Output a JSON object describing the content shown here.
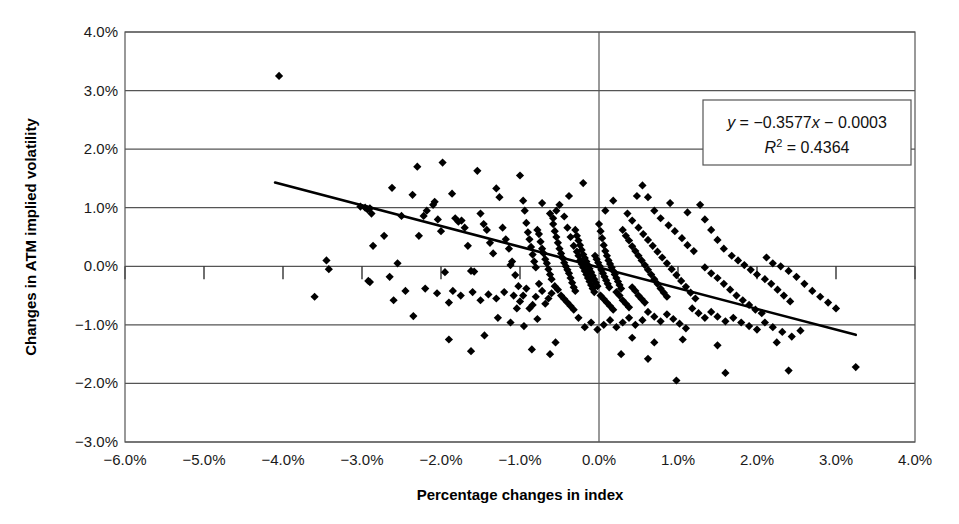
{
  "chart_data": {
    "type": "scatter",
    "title": "",
    "xlabel": "Percentage changes in index",
    "ylabel": "Changes in ATM implied volatility",
    "xlim": [
      -6.0,
      4.0
    ],
    "ylim": [
      -3.0,
      4.0
    ],
    "x_ticks": [
      "-6.0%",
      "-5.0%",
      "-4.0%",
      "-3.0%",
      "-2.0%",
      "-1.0%",
      "0.0%",
      "1.0%",
      "2.0%",
      "3.0%",
      "4.0%"
    ],
    "y_ticks": [
      "4.0%",
      "3.0%",
      "2.0%",
      "1.0%",
      "0.0%",
      "-1.0%",
      "-2.0%",
      "-3.0%"
    ],
    "x_tick_values": [
      -6,
      -5,
      -4,
      -3,
      -2,
      -1,
      0,
      1,
      2,
      3,
      4
    ],
    "y_tick_values": [
      4,
      3,
      2,
      1,
      0,
      -1,
      -2,
      -3
    ],
    "grid": "horizontal-gridlines-plus-zero-vertical",
    "legend": "none",
    "marker": "diamond",
    "marker_color": "#000000",
    "trendline": {
      "equation_label": "y = −0.3577x − 0.0003",
      "r2_label": "R² = 0.4364",
      "slope": -0.3577,
      "intercept": -0.0003,
      "r_squared": 0.4364,
      "x_start": -4.1,
      "x_end": 3.25,
      "y_start": 1.43,
      "y_end": -1.17,
      "color": "#000000"
    },
    "annotations": [
      {
        "name": "regression-box",
        "line1": "y = −0.3577x − 0.0003",
        "line2": "R² = 0.4364"
      }
    ],
    "points": [
      [
        -4.05,
        3.25
      ],
      [
        -3.02,
        1.02
      ],
      [
        -2.96,
        1.0
      ],
      [
        -2.93,
        0.97
      ],
      [
        -2.9,
        0.99
      ],
      [
        -2.88,
        0.9
      ],
      [
        -2.86,
        0.35
      ],
      [
        -2.92,
        -0.25
      ],
      [
        -2.9,
        -0.27
      ],
      [
        -2.62,
        1.34
      ],
      [
        -2.5,
        0.86
      ],
      [
        -2.36,
        1.22
      ],
      [
        -2.3,
        1.7
      ],
      [
        -2.28,
        0.52
      ],
      [
        -2.22,
        0.86
      ],
      [
        -2.18,
        0.95
      ],
      [
        -2.1,
        1.05
      ],
      [
        -2.08,
        1.1
      ],
      [
        -2.04,
        0.8
      ],
      [
        -2.0,
        0.6
      ],
      [
        -1.98,
        1.77
      ],
      [
        -1.95,
        -0.1
      ],
      [
        -1.9,
        -0.62
      ],
      [
        -1.86,
        1.24
      ],
      [
        -1.82,
        0.82
      ],
      [
        -1.78,
        0.76
      ],
      [
        -1.74,
        0.78
      ],
      [
        -1.7,
        0.66
      ],
      [
        -1.66,
        0.35
      ],
      [
        -1.62,
        -0.08
      ],
      [
        -1.58,
        -0.09
      ],
      [
        -1.54,
        1.63
      ],
      [
        -1.5,
        0.9
      ],
      [
        -1.46,
        0.72
      ],
      [
        -1.42,
        0.62
      ],
      [
        -1.38,
        0.4
      ],
      [
        -1.34,
        0.22
      ],
      [
        -1.3,
        1.33
      ],
      [
        -1.26,
        1.18
      ],
      [
        -1.22,
        0.66
      ],
      [
        -1.18,
        0.46
      ],
      [
        -1.14,
        0.3
      ],
      [
        -1.1,
        0.08
      ],
      [
        -1.06,
        -0.15
      ],
      [
        -1.02,
        -0.34
      ],
      [
        -1.0,
        1.55
      ],
      [
        -0.96,
        1.12
      ],
      [
        -0.94,
        0.95
      ],
      [
        -0.92,
        0.74
      ],
      [
        -0.9,
        0.58
      ],
      [
        -0.88,
        0.46
      ],
      [
        -0.86,
        0.33
      ],
      [
        -0.84,
        0.2
      ],
      [
        -0.82,
        0.08
      ],
      [
        -0.8,
        -0.02
      ],
      [
        -0.78,
        0.62
      ],
      [
        -0.76,
        0.55
      ],
      [
        -0.74,
        0.42
      ],
      [
        -0.72,
        0.3
      ],
      [
        -0.7,
        0.22
      ],
      [
        -0.68,
        0.12
      ],
      [
        -0.66,
        0.05
      ],
      [
        -0.64,
        -0.05
      ],
      [
        -0.62,
        -0.14
      ],
      [
        -0.6,
        -0.22
      ],
      [
        -0.58,
        0.72
      ],
      [
        -0.56,
        0.6
      ],
      [
        -0.54,
        0.5
      ],
      [
        -0.52,
        0.4
      ],
      [
        -0.5,
        0.3
      ],
      [
        -0.48,
        0.22
      ],
      [
        -0.46,
        0.14
      ],
      [
        -0.44,
        0.06
      ],
      [
        -0.42,
        0.0
      ],
      [
        -0.4,
        -0.06
      ],
      [
        -0.38,
        -0.12
      ],
      [
        -0.36,
        -0.2
      ],
      [
        -0.34,
        -0.28
      ],
      [
        -0.32,
        -0.36
      ],
      [
        -0.3,
        -0.42
      ],
      [
        -0.62,
        0.9
      ],
      [
        -0.58,
        0.82
      ],
      [
        -0.54,
        0.95
      ],
      [
        -0.5,
        1.05
      ],
      [
        -0.44,
        0.85
      ],
      [
        -0.4,
        0.66
      ],
      [
        -0.36,
        0.5
      ],
      [
        -0.32,
        0.35
      ],
      [
        -0.28,
        0.25
      ],
      [
        -0.26,
        0.18
      ],
      [
        -0.24,
        0.1
      ],
      [
        -0.22,
        0.04
      ],
      [
        -0.2,
        -0.02
      ],
      [
        -0.18,
        -0.08
      ],
      [
        -0.16,
        -0.14
      ],
      [
        -0.14,
        -0.2
      ],
      [
        -0.12,
        -0.26
      ],
      [
        -0.1,
        -0.32
      ],
      [
        -0.08,
        -0.38
      ],
      [
        -0.06,
        -0.44
      ],
      [
        -0.3,
        0.62
      ],
      [
        -0.28,
        0.52
      ],
      [
        -0.26,
        0.44
      ],
      [
        -0.24,
        0.36
      ],
      [
        -0.22,
        0.28
      ],
      [
        -0.2,
        0.2
      ],
      [
        -0.18,
        0.14
      ],
      [
        -0.16,
        0.08
      ],
      [
        -0.14,
        0.02
      ],
      [
        -0.12,
        -0.04
      ],
      [
        -0.1,
        -0.1
      ],
      [
        -0.08,
        -0.16
      ],
      [
        -0.06,
        -0.22
      ],
      [
        -0.04,
        -0.28
      ],
      [
        -0.02,
        -0.34
      ],
      [
        0.0,
        0.72
      ],
      [
        0.02,
        0.6
      ],
      [
        0.04,
        0.48
      ],
      [
        0.06,
        0.36
      ],
      [
        0.08,
        0.26
      ],
      [
        0.1,
        0.18
      ],
      [
        0.12,
        0.1
      ],
      [
        0.14,
        0.04
      ],
      [
        0.16,
        -0.02
      ],
      [
        0.18,
        -0.08
      ],
      [
        0.2,
        -0.14
      ],
      [
        0.22,
        -0.2
      ],
      [
        0.24,
        -0.26
      ],
      [
        0.26,
        -0.32
      ],
      [
        0.28,
        -0.38
      ],
      [
        -0.05,
        0.18
      ],
      [
        -0.03,
        0.12
      ],
      [
        -0.01,
        0.06
      ],
      [
        0.01,
        0.0
      ],
      [
        0.03,
        -0.06
      ],
      [
        0.05,
        -0.12
      ],
      [
        0.07,
        -0.18
      ],
      [
        0.09,
        -0.24
      ],
      [
        0.11,
        -0.3
      ],
      [
        0.13,
        -0.36
      ],
      [
        -0.48,
        -0.5
      ],
      [
        -0.44,
        -0.56
      ],
      [
        -0.4,
        -0.62
      ],
      [
        -0.36,
        -0.68
      ],
      [
        -0.32,
        -0.74
      ],
      [
        -0.52,
        -0.4
      ],
      [
        -0.56,
        -0.34
      ],
      [
        -0.6,
        -0.46
      ],
      [
        -0.64,
        -0.55
      ],
      [
        -0.68,
        -0.64
      ],
      [
        -0.72,
        -0.42
      ],
      [
        -0.76,
        -0.3
      ],
      [
        -0.8,
        -0.52
      ],
      [
        -0.84,
        -0.66
      ],
      [
        -0.88,
        -0.72
      ],
      [
        -0.92,
        -0.38
      ],
      [
        -0.96,
        -0.5
      ],
      [
        -1.0,
        -0.6
      ],
      [
        -1.04,
        -0.72
      ],
      [
        -1.08,
        -0.5
      ],
      [
        -1.2,
        -0.44
      ],
      [
        -1.3,
        -0.55
      ],
      [
        -1.4,
        -0.48
      ],
      [
        -1.5,
        -0.58
      ],
      [
        -1.6,
        -0.44
      ],
      [
        -1.75,
        -0.5
      ],
      [
        -1.85,
        -0.42
      ],
      [
        -2.05,
        -0.46
      ],
      [
        -2.2,
        -0.38
      ],
      [
        -2.45,
        -0.42
      ],
      [
        -1.28,
        -0.88
      ],
      [
        -1.12,
        -0.96
      ],
      [
        -0.95,
        -1.02
      ],
      [
        -0.78,
        -0.9
      ],
      [
        0.02,
        -0.5
      ],
      [
        0.06,
        -0.56
      ],
      [
        0.1,
        -0.62
      ],
      [
        0.14,
        -0.68
      ],
      [
        0.18,
        -0.74
      ],
      [
        0.22,
        -0.44
      ],
      [
        0.26,
        -0.5
      ],
      [
        0.3,
        -0.58
      ],
      [
        0.34,
        -0.64
      ],
      [
        0.38,
        -0.7
      ],
      [
        0.42,
        -0.36
      ],
      [
        0.46,
        -0.42
      ],
      [
        0.5,
        -0.5
      ],
      [
        0.54,
        -0.56
      ],
      [
        0.58,
        -0.62
      ],
      [
        0.3,
        0.62
      ],
      [
        0.34,
        0.52
      ],
      [
        0.38,
        0.44
      ],
      [
        0.42,
        0.34
      ],
      [
        0.46,
        0.26
      ],
      [
        0.5,
        0.18
      ],
      [
        0.54,
        0.1
      ],
      [
        0.58,
        0.02
      ],
      [
        0.62,
        -0.06
      ],
      [
        0.66,
        -0.14
      ],
      [
        0.7,
        -0.22
      ],
      [
        0.74,
        -0.3
      ],
      [
        0.78,
        -0.38
      ],
      [
        0.82,
        -0.45
      ],
      [
        0.86,
        -0.52
      ],
      [
        0.36,
        0.9
      ],
      [
        0.42,
        0.78
      ],
      [
        0.5,
        0.66
      ],
      [
        0.56,
        0.55
      ],
      [
        0.62,
        0.45
      ],
      [
        0.68,
        0.35
      ],
      [
        0.74,
        0.25
      ],
      [
        0.8,
        0.15
      ],
      [
        0.86,
        0.05
      ],
      [
        0.92,
        -0.05
      ],
      [
        0.98,
        -0.15
      ],
      [
        1.04,
        -0.25
      ],
      [
        1.1,
        -0.35
      ],
      [
        1.16,
        -0.45
      ],
      [
        1.22,
        -0.55
      ],
      [
        0.55,
        1.38
      ],
      [
        0.48,
        1.2
      ],
      [
        0.62,
        1.18
      ],
      [
        0.7,
        0.95
      ],
      [
        0.78,
        0.82
      ],
      [
        0.88,
        0.7
      ],
      [
        0.96,
        0.6
      ],
      [
        1.05,
        0.48
      ],
      [
        1.12,
        0.36
      ],
      [
        1.2,
        0.26
      ],
      [
        1.28,
        1.05
      ],
      [
        1.34,
        0.8
      ],
      [
        1.42,
        0.62
      ],
      [
        1.5,
        0.45
      ],
      [
        1.58,
        0.3
      ],
      [
        1.34,
        -0.02
      ],
      [
        1.42,
        -0.12
      ],
      [
        1.5,
        -0.2
      ],
      [
        1.58,
        -0.3
      ],
      [
        1.66,
        -0.4
      ],
      [
        1.74,
        -0.5
      ],
      [
        1.82,
        -0.58
      ],
      [
        1.9,
        -0.66
      ],
      [
        1.98,
        -0.74
      ],
      [
        2.06,
        -0.8
      ],
      [
        1.68,
        0.18
      ],
      [
        1.76,
        0.1
      ],
      [
        1.84,
        0.02
      ],
      [
        1.92,
        -0.06
      ],
      [
        2.0,
        -0.14
      ],
      [
        2.1,
        -0.22
      ],
      [
        2.18,
        -0.3
      ],
      [
        2.26,
        -0.4
      ],
      [
        2.34,
        -0.5
      ],
      [
        2.42,
        -0.6
      ],
      [
        2.12,
        0.15
      ],
      [
        2.2,
        0.05
      ],
      [
        2.3,
        0.0
      ],
      [
        2.4,
        -0.08
      ],
      [
        2.5,
        -0.18
      ],
      [
        2.6,
        -0.3
      ],
      [
        2.7,
        -0.42
      ],
      [
        2.8,
        -0.52
      ],
      [
        2.9,
        -0.62
      ],
      [
        3.0,
        -0.72
      ],
      [
        1.18,
        -0.72
      ],
      [
        1.26,
        -0.8
      ],
      [
        1.34,
        -0.88
      ],
      [
        1.42,
        -0.78
      ],
      [
        1.5,
        -0.86
      ],
      [
        1.6,
        -0.94
      ],
      [
        1.7,
        -0.88
      ],
      [
        1.8,
        -0.96
      ],
      [
        1.9,
        -1.02
      ],
      [
        2.0,
        -1.08
      ],
      [
        2.1,
        -0.96
      ],
      [
        2.2,
        -1.04
      ],
      [
        2.32,
        -1.12
      ],
      [
        2.44,
        -1.2
      ],
      [
        2.55,
        -1.1
      ],
      [
        0.62,
        -0.78
      ],
      [
        0.7,
        -0.86
      ],
      [
        0.78,
        -0.94
      ],
      [
        0.86,
        -0.82
      ],
      [
        0.94,
        -0.9
      ],
      [
        1.02,
        -0.98
      ],
      [
        1.1,
        -1.06
      ],
      [
        0.55,
        -0.92
      ],
      [
        0.46,
        -1.0
      ],
      [
        0.38,
        -0.88
      ],
      [
        0.3,
        -0.96
      ],
      [
        0.22,
        -1.04
      ],
      [
        0.14,
        -0.92
      ],
      [
        0.06,
        -1.0
      ],
      [
        -0.02,
        -1.08
      ],
      [
        -0.1,
        -0.96
      ],
      [
        -0.18,
        -1.04
      ],
      [
        -0.26,
        -0.88
      ],
      [
        0.42,
        -1.22
      ],
      [
        0.7,
        -1.3
      ],
      [
        1.06,
        -1.25
      ],
      [
        1.5,
        -1.35
      ],
      [
        2.25,
        -1.3
      ],
      [
        -0.55,
        -1.3
      ],
      [
        -0.85,
        -1.42
      ],
      [
        -1.45,
        -1.18
      ],
      [
        -1.9,
        -1.25
      ],
      [
        0.98,
        -1.95
      ],
      [
        1.6,
        -1.82
      ],
      [
        2.4,
        -1.78
      ],
      [
        3.25,
        -1.72
      ],
      [
        0.28,
        -1.5
      ],
      [
        0.62,
        -1.58
      ],
      [
        -0.62,
        -1.5
      ],
      [
        -1.62,
        -1.45
      ],
      [
        -2.55,
        0.05
      ],
      [
        -2.72,
        0.52
      ],
      [
        -2.6,
        -0.58
      ],
      [
        -3.45,
        0.1
      ],
      [
        -3.42,
        -0.05
      ],
      [
        -3.6,
        -0.52
      ],
      [
        -2.35,
        -0.85
      ],
      [
        -2.65,
        -0.18
      ],
      [
        0.9,
        1.08
      ],
      [
        1.12,
        0.92
      ],
      [
        -0.72,
        1.08
      ],
      [
        -0.2,
        1.42
      ],
      [
        0.08,
        0.95
      ],
      [
        0.18,
        1.12
      ],
      [
        -0.38,
        1.2
      ],
      [
        -1.12,
        0.02
      ]
    ]
  },
  "axes": {
    "x_title": "Percentage changes in index",
    "y_title": "Changes in ATM implied volatility"
  }
}
